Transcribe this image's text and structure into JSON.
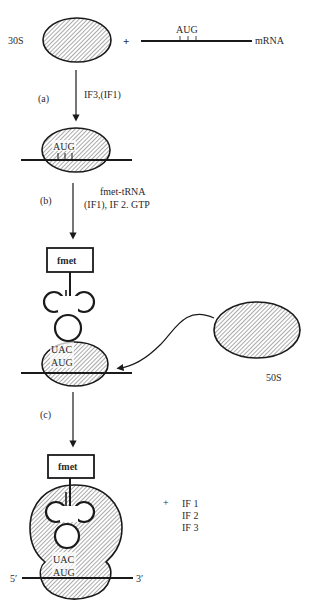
{
  "diagram": {
    "colors": {
      "ink": "#1a1a1a",
      "hatch": "#555555",
      "background": "#ffffff"
    },
    "subunits": {
      "small": "30S",
      "large": "50S"
    },
    "mrna": {
      "label": "mRNA",
      "start_codon": "AUG",
      "five_prime": "5′",
      "three_prime": "3′"
    },
    "plus_sign": "+",
    "steps": [
      {
        "id": "a",
        "label": "(a)",
        "factors": [
          "IF3,(IF1)"
        ]
      },
      {
        "id": "b",
        "label": "(b)",
        "factors": [
          "fmet-tRNA",
          "(IF1), IF 2. GTP"
        ]
      },
      {
        "id": "c",
        "label": "(c)",
        "factors": []
      }
    ],
    "trna": {
      "amino_acid": "fmet",
      "anticodon": "UAC",
      "codon": "AUG"
    },
    "released_factors": {
      "plus": "+",
      "items": [
        "IF 1",
        "IF 2",
        "IF 3"
      ]
    }
  }
}
